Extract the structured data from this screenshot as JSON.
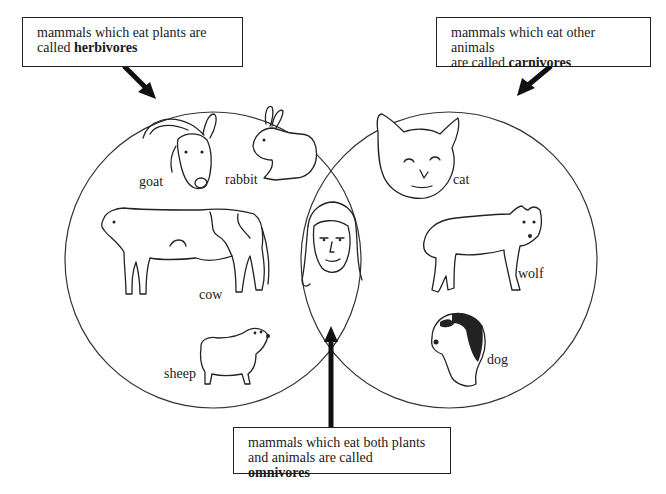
{
  "diagram": {
    "sets": [
      {
        "id": "herbivores",
        "name": "herbivores",
        "members": [
          "goat",
          "rabbit",
          "cow",
          "sheep"
        ]
      },
      {
        "id": "carnivores",
        "name": "carnivores",
        "members": [
          "cat",
          "wolf",
          "dog"
        ]
      },
      {
        "id": "omnivores",
        "name": "omnivores",
        "overlap_of": [
          "herbivores",
          "carnivores"
        ],
        "members": [
          "human (girl)"
        ]
      }
    ],
    "callouts": {
      "herbivores": {
        "line1": "mammals which eat plants are",
        "line2_prefix": "called ",
        "term": "herbivores"
      },
      "carnivores": {
        "line1": "mammals which eat other animals",
        "line2_prefix": "are called ",
        "term": "carnivores"
      },
      "omnivores": {
        "line1": "mammals which eat both plants",
        "line2_prefix": "and animals are called ",
        "term": "omnivores"
      }
    },
    "labels": {
      "goat": "goat",
      "rabbit": "rabbit",
      "cow": "cow",
      "sheep": "sheep",
      "cat": "cat",
      "wolf": "wolf",
      "dog": "dog"
    },
    "illustrations": [
      "goat-icon",
      "rabbit-icon",
      "cow-icon",
      "sheep-icon",
      "cat-icon",
      "wolf-icon",
      "dog-icon",
      "girl-face-icon"
    ],
    "colors": {
      "ink": "#222222",
      "background": "#ffffff"
    }
  }
}
